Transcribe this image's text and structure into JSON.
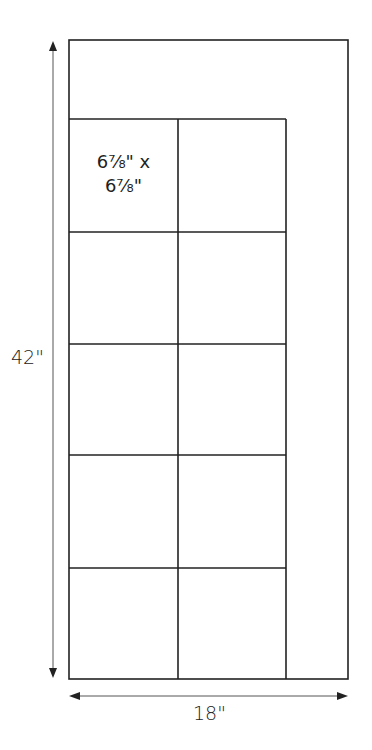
{
  "diagram": {
    "type": "quilt-layout",
    "outer": {
      "width_label": "18\"",
      "height_label": "42\""
    },
    "block_label_line1": "6⅞\" x",
    "block_label_line2": "6⅞\"",
    "grid": {
      "columns": 2,
      "rows": 5,
      "block_size": "6⅞\" x 6⅞\""
    },
    "colors": {
      "stroke": "#222222",
      "arrow": "#222222",
      "background": "#ffffff"
    }
  }
}
